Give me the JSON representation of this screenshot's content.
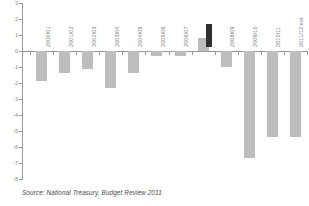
{
  "chart_data": {
    "type": "bar",
    "title": "",
    "subtitle": "",
    "xlabel": "",
    "ylabel": "",
    "ylim": [
      -8,
      3
    ],
    "yticks": [
      "3",
      "2",
      "1",
      "0",
      "-1",
      "-2",
      "-3",
      "-4",
      "-5",
      "-6",
      "-7",
      "-8"
    ],
    "grid": false,
    "legend": null,
    "categories": [
      "2000/01",
      "2001/02",
      "2002/03",
      "2003/04",
      "2004/05",
      "2005/06",
      "2006/07",
      "2007/08",
      "2008/09",
      "2009/10",
      "2010/11",
      "2011/12 est"
    ],
    "values": [
      -1.9,
      -1.4,
      -1.1,
      -2.3,
      -1.4,
      -0.3,
      -0.3,
      0.8,
      -1.0,
      -6.7,
      -5.4,
      -5.4
    ],
    "highlight_index": 7,
    "bar_color": "#bdbdbd",
    "axis_color": "#9a9a9a",
    "label_color": "#7c7c7c"
  },
  "source": {
    "note": "Source: National Treasury, Budget Review 2011"
  }
}
